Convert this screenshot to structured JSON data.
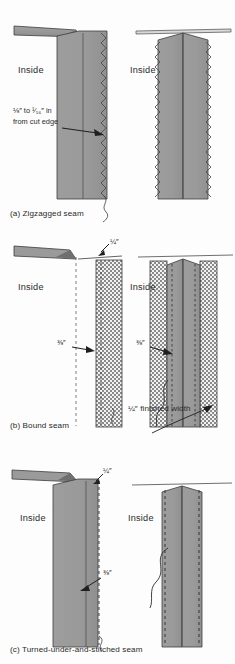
{
  "figure": {
    "fabric_color": "#9a9a9a",
    "fabric_shadow_color": "#8b8b8b",
    "line_color": "#3a3a3a",
    "background": "#fdfdfd"
  },
  "panels": [
    {
      "id": "a",
      "caption": "(a) Zigzagged seam",
      "left_view": {
        "inside_label": "Inside",
        "note": {
          "line1": "⅛″ to ¹⁄₁₆″ in",
          "line2": "from cut edge"
        }
      },
      "right_view": {
        "inside_label": "Inside"
      },
      "finish_type": "zigzag"
    },
    {
      "id": "b",
      "caption": "(b) Bound seam",
      "left_view": {
        "inside_label": "Inside",
        "top_measure": "¼″",
        "side_measure": "⅜″"
      },
      "right_view": {
        "inside_label": "Inside",
        "side_measure": "⅜″",
        "finished_width": "¼″ finished width"
      },
      "finish_type": "bound"
    },
    {
      "id": "c",
      "caption": "(c) Turned-under-and-stitched seam",
      "left_view": {
        "inside_label": "Inside",
        "top_measure": "¼″",
        "side_measure": "⅜″"
      },
      "right_view": {
        "inside_label": "Inside"
      },
      "finish_type": "turned-under"
    }
  ]
}
